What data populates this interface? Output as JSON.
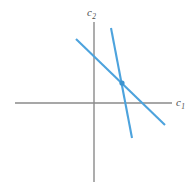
{
  "figure": {
    "background_color": "#ffffff",
    "width": 195,
    "height": 194,
    "axis_color": "#8a8a8a",
    "line_color": "#4da3dd",
    "marker_color": "#3b93cf"
  },
  "axes": {
    "horizontal": {
      "label_text": "c",
      "label_subscript": "1",
      "x_start": 15,
      "x_end": 172,
      "y": 103
    },
    "vertical": {
      "label_text": "c",
      "label_subscript": "2",
      "x": 94,
      "y_start": 22,
      "y_end": 182
    },
    "origin": {
      "x": 94,
      "y": 103
    }
  },
  "chart_data": {
    "type": "line",
    "title": "",
    "xlabel": "c1",
    "ylabel": "c2",
    "grid": false,
    "legend": "none",
    "axis_origin_px": {
      "x": 94,
      "y": 103
    },
    "xlim_px": [
      15,
      172
    ],
    "ylim_px": [
      22,
      182
    ],
    "series": [
      {
        "name": "flat-budget-line",
        "description": "shallow downward-sloping budget line",
        "points_px": [
          {
            "x": 76,
            "y": 39
          },
          {
            "x": 165,
            "y": 125
          }
        ],
        "slope_px": -0.966,
        "color": "#4da3dd",
        "x_intercept_px": 148,
        "y_intercept_px": 56
      },
      {
        "name": "steep-budget-line",
        "description": "steep downward-sloping budget line",
        "points_px": [
          {
            "x": 111,
            "y": 28
          },
          {
            "x": 132,
            "y": 138
          }
        ],
        "slope_px": -5.238,
        "color": "#4da3dd",
        "x_intercept_px": 125,
        "y_intercept_px": -61
      }
    ],
    "annotations": [
      {
        "name": "intersection-point",
        "x_px": 122,
        "y_px": 83,
        "color": "#3b93cf",
        "radius_px": 2.6
      }
    ]
  }
}
